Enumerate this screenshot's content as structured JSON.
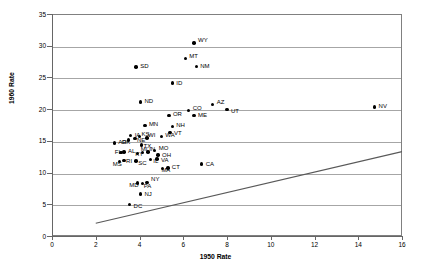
{
  "chart_data": {
    "type": "scatter",
    "title": "",
    "xlabel": "1950 Rate",
    "ylabel": "1960 Rate",
    "xlim": [
      0,
      16
    ],
    "ylim": [
      0,
      35
    ],
    "xticks": [
      0,
      2,
      4,
      6,
      8,
      10,
      12,
      14,
      16
    ],
    "yticks": [
      0,
      5,
      10,
      15,
      20,
      25,
      30,
      35
    ],
    "grid": "horizontal",
    "legend": "none",
    "point_color": "#000000",
    "grid_color": "#a6a6a6",
    "frame_color": "#808080",
    "trend_line": {
      "label": "",
      "x": [
        2.0,
        16.0
      ],
      "y": [
        2.0,
        13.3
      ],
      "color": "#595959"
    },
    "points": [
      {
        "label": "WY",
        "x": 6.45,
        "y": 30.6,
        "lx": 4,
        "ly": -3
      },
      {
        "label": "MT",
        "x": 6.05,
        "y": 28.1,
        "lx": 4,
        "ly": -3
      },
      {
        "label": "NM",
        "x": 6.55,
        "y": 26.9,
        "lx": 4,
        "ly": 0
      },
      {
        "label": "SD",
        "x": 3.8,
        "y": 26.8,
        "lx": 4,
        "ly": -1
      },
      {
        "label": "ID",
        "x": 5.45,
        "y": 24.3,
        "lx": 4,
        "ly": 0
      },
      {
        "label": "ND",
        "x": 4.0,
        "y": 21.3,
        "lx": 4,
        "ly": -1
      },
      {
        "label": "AZ",
        "x": 7.3,
        "y": 20.9,
        "lx": 4,
        "ly": -2
      },
      {
        "label": "UT",
        "x": 7.95,
        "y": 20.1,
        "lx": 4,
        "ly": 1
      },
      {
        "label": "NV",
        "x": 14.7,
        "y": 20.5,
        "lx": 4,
        "ly": -1
      },
      {
        "label": "CO",
        "x": 6.2,
        "y": 19.9,
        "lx": 4,
        "ly": -3
      },
      {
        "label": "ME",
        "x": 6.45,
        "y": 19.2,
        "lx": 4,
        "ly": 0
      },
      {
        "label": "OR",
        "x": 5.3,
        "y": 19.2,
        "lx": 4,
        "ly": -1
      },
      {
        "label": "NH",
        "x": 5.45,
        "y": 17.4,
        "lx": 4,
        "ly": -2
      },
      {
        "label": "VT",
        "x": 5.35,
        "y": 16.5,
        "lx": 4,
        "ly": 1
      },
      {
        "label": "MN",
        "x": 4.2,
        "y": 17.6,
        "lx": 4,
        "ly": -1
      },
      {
        "label": "WA",
        "x": 4.95,
        "y": 15.8,
        "lx": 4,
        "ly": -2
      },
      {
        "label": "IA",
        "x": 3.55,
        "y": 16.0,
        "lx": 4,
        "ly": -1
      },
      {
        "label": "KS",
        "x": 3.95,
        "y": 15.8,
        "lx": 2,
        "ly": -3
      },
      {
        "label": "NE",
        "x": 3.75,
        "y": 15.5,
        "lx": 2,
        "ly": 1
      },
      {
        "label": "WI",
        "x": 4.3,
        "y": 15.6,
        "lx": 1,
        "ly": -3
      },
      {
        "label": "OK",
        "x": 3.45,
        "y": 15.3,
        "lx": -7,
        "ly": 2
      },
      {
        "label": "AR",
        "x": 2.8,
        "y": 14.8,
        "lx": 4,
        "ly": -1
      },
      {
        "label": "TX",
        "x": 4.05,
        "y": 14.5,
        "lx": 2,
        "ly": 1
      },
      {
        "label": "AL",
        "x": 3.25,
        "y": 13.4,
        "lx": 4,
        "ly": -1
      },
      {
        "label": "FL",
        "x": 3.1,
        "y": 13.3,
        "lx": -6,
        "ly": -1
      },
      {
        "label": "MO",
        "x": 4.65,
        "y": 13.6,
        "lx": 4,
        "ly": -3
      },
      {
        "label": "IN",
        "x": 4.35,
        "y": 13.4,
        "lx": 1,
        "ly": -3
      },
      {
        "label": "MI",
        "x": 4.1,
        "y": 13.3,
        "lx": -2,
        "ly": -4
      },
      {
        "label": "KY",
        "x": 3.85,
        "y": 13.2,
        "lx": -2,
        "ly": 1
      },
      {
        "label": "OH",
        "x": 4.8,
        "y": 12.9,
        "lx": 4,
        "ly": 0
      },
      {
        "label": "VA",
        "x": 4.75,
        "y": 12.3,
        "lx": 4,
        "ly": 1
      },
      {
        "label": "IL",
        "x": 4.45,
        "y": 12.2,
        "lx": 3,
        "ly": 1
      },
      {
        "label": "SC",
        "x": 3.8,
        "y": 12.0,
        "lx": 2,
        "ly": 2
      },
      {
        "label": "RI",
        "x": 3.25,
        "y": 12.1,
        "lx": 2,
        "ly": 1
      },
      {
        "label": "MS",
        "x": 3.05,
        "y": 11.9,
        "lx": -7,
        "ly": 2
      },
      {
        "label": "CT",
        "x": 5.25,
        "y": 10.9,
        "lx": 4,
        "ly": -1
      },
      {
        "label": "MA",
        "x": 5.0,
        "y": 10.8,
        "lx": -1,
        "ly": 2
      },
      {
        "label": "CA",
        "x": 6.8,
        "y": 11.5,
        "lx": 4,
        "ly": 0
      },
      {
        "label": "NY",
        "x": 4.3,
        "y": 8.6,
        "lx": 4,
        "ly": -3
      },
      {
        "label": "PA",
        "x": 4.1,
        "y": 8.4,
        "lx": 1,
        "ly": 2
      },
      {
        "label": "MD",
        "x": 3.85,
        "y": 8.5,
        "lx": -8,
        "ly": 2
      },
      {
        "label": "NJ",
        "x": 4.0,
        "y": 6.8,
        "lx": 4,
        "ly": 0
      },
      {
        "label": "DC",
        "x": 3.5,
        "y": 5.1,
        "lx": 4,
        "ly": 1
      }
    ]
  }
}
